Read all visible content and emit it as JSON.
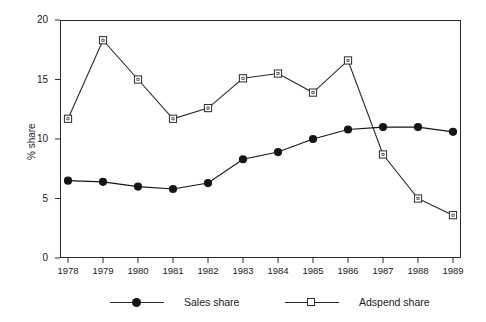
{
  "chart_data": {
    "type": "line",
    "title": "",
    "subtitle": "",
    "xlabel": "",
    "ylabel": "% share",
    "categories": [
      "1978",
      "1979",
      "1980",
      "1981",
      "1982",
      "1983",
      "1984",
      "1985",
      "1986",
      "1987",
      "1988",
      "1989"
    ],
    "x": [
      1978,
      1979,
      1980,
      1981,
      1982,
      1983,
      1984,
      1985,
      1986,
      1987,
      1988,
      1989
    ],
    "series": [
      {
        "name": "Sales share",
        "marker": "filled-circle",
        "color": "#151515",
        "values": [
          6.5,
          6.4,
          6.0,
          5.8,
          6.3,
          8.3,
          8.9,
          10.0,
          10.8,
          11.0,
          11.0,
          10.6
        ]
      },
      {
        "name": "Adspend share",
        "marker": "open-square",
        "color": "#2b2b2b",
        "values": [
          11.7,
          18.3,
          15.0,
          11.7,
          12.6,
          15.1,
          15.5,
          13.9,
          16.6,
          8.7,
          5.0,
          3.6
        ]
      }
    ],
    "ylim": [
      0,
      20
    ],
    "yticks": [
      0,
      5,
      10,
      15,
      20
    ],
    "ytick_labels": [
      "0",
      "5",
      "10",
      "15",
      "20"
    ],
    "xlim": [
      1977.5,
      1989.5
    ],
    "grid": false,
    "legend_position": "bottom",
    "legend_entries": [
      "Sales share",
      "Adspend share"
    ],
    "frame": "box"
  },
  "legend": {
    "sales_label": "Sales share",
    "adspend_label": "Adspend share"
  },
  "axis": {
    "y_title": "% share"
  }
}
